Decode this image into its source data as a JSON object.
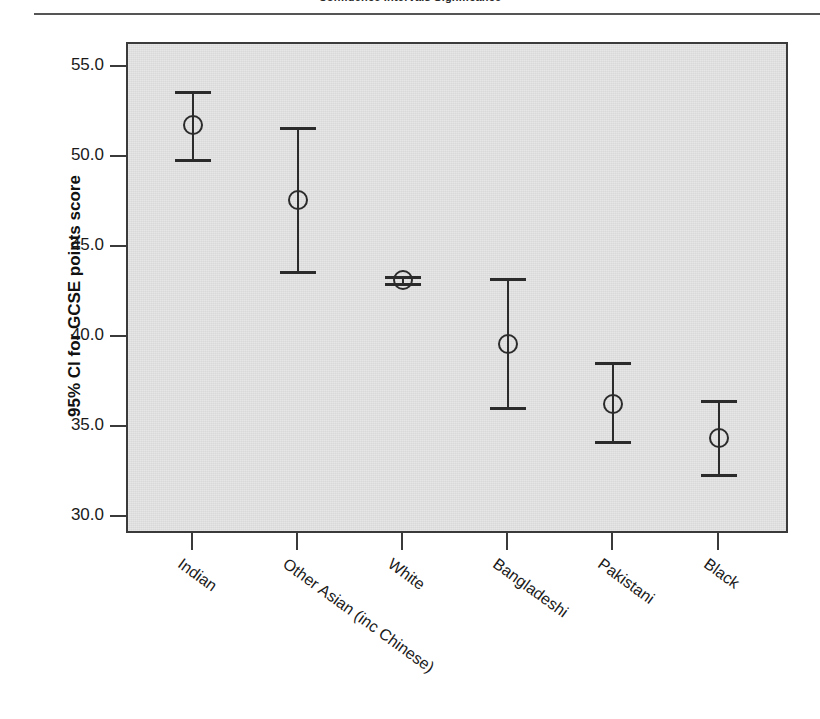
{
  "page": {
    "top_caption": "Confidence Intervals Significance"
  },
  "chart_data": {
    "type": "scatter",
    "title": "",
    "xlabel": "",
    "ylabel": "95% CI for GCSE points score",
    "ylim": [
      29.0,
      56.3
    ],
    "yticks": [
      30.0,
      35.0,
      40.0,
      45.0,
      50.0,
      55.0
    ],
    "ytick_labels": [
      "30.0",
      "35.0",
      "40.0",
      "45.0",
      "50.0",
      "55.0"
    ],
    "grid": false,
    "legend": "none",
    "error_bar_type": "95% confidence interval",
    "categories": [
      "Indian",
      "Other Asian (inc Chinese)",
      "White",
      "Bangladeshi",
      "Pakistani",
      "Black"
    ],
    "values": [
      51.8,
      47.6,
      43.2,
      39.6,
      36.3,
      34.4
    ],
    "ci_lower": [
      49.9,
      43.7,
      43.0,
      36.1,
      34.2,
      32.4
    ],
    "ci_upper": [
      53.7,
      51.7,
      43.4,
      43.3,
      38.6,
      36.5
    ],
    "points": [
      {
        "category": "Indian",
        "mean": 51.8,
        "lower": 49.9,
        "upper": 53.7
      },
      {
        "category": "Other Asian (inc Chinese)",
        "mean": 47.6,
        "lower": 43.7,
        "upper": 51.7
      },
      {
        "category": "White",
        "mean": 43.2,
        "lower": 43.0,
        "upper": 43.4
      },
      {
        "category": "Bangladeshi",
        "mean": 39.6,
        "lower": 36.1,
        "upper": 43.3
      },
      {
        "category": "Pakistani",
        "mean": 36.3,
        "lower": 34.2,
        "upper": 38.6
      },
      {
        "category": "Black",
        "mean": 34.4,
        "lower": 32.4,
        "upper": 36.5
      }
    ]
  },
  "colors": {
    "panel_background": "#d9d9d9",
    "frame": "#3a3a3a",
    "marker": "#2b2b2b",
    "text": "#1a1a1a",
    "page_background": "#ffffff"
  }
}
